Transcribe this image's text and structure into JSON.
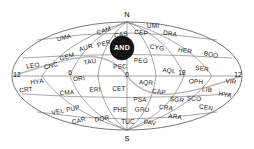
{
  "map": {
    "title": "Celestial constellation map",
    "projection": "hammer-aitoff-oval",
    "poles": {
      "north_label": "N",
      "south_label": "S"
    },
    "hour_markers": [
      {
        "label": "12",
        "x": 17,
        "y": 75
      },
      {
        "label": "6",
        "x": 70,
        "y": 73
      },
      {
        "label": "0",
        "x": 127,
        "y": 75
      },
      {
        "label": "18",
        "x": 182,
        "y": 73
      },
      {
        "label": "12",
        "x": 238,
        "y": 75
      }
    ],
    "colors": {
      "background": "#ffffff",
      "graticule": "#6d6d6d",
      "outline": "#555555",
      "ecliptic": "#b9b9b9",
      "label_text": "#1a1a1a",
      "highlight_fill": "#151515",
      "highlight_text": "#ffffff"
    },
    "highlight": {
      "label": "AND",
      "x": 122,
      "y": 48,
      "radius": 12
    },
    "constellations": [
      {
        "label": "CAM",
        "x": 104,
        "y": 31,
        "rotate": -20
      },
      {
        "label": "CAS",
        "x": 121,
        "y": 35,
        "rotate": -10
      },
      {
        "label": "CEP",
        "x": 141,
        "y": 33,
        "rotate": 8
      },
      {
        "label": "UMI",
        "x": 153,
        "y": 26,
        "rotate": 0
      },
      {
        "label": "DRA",
        "x": 170,
        "y": 34,
        "rotate": 10
      },
      {
        "label": "UMA",
        "x": 64,
        "y": 38,
        "rotate": -14
      },
      {
        "label": "AUR",
        "x": 86,
        "y": 48,
        "rotate": -18
      },
      {
        "label": "PER",
        "x": 104,
        "y": 44,
        "rotate": -16
      },
      {
        "label": "CYG",
        "x": 157,
        "y": 48,
        "rotate": 10
      },
      {
        "label": "HER",
        "x": 185,
        "y": 51,
        "rotate": 8
      },
      {
        "label": "BOO",
        "x": 211,
        "y": 55,
        "rotate": 12
      },
      {
        "label": "GEM",
        "x": 67,
        "y": 57,
        "rotate": -16
      },
      {
        "label": "TAU",
        "x": 90,
        "y": 62,
        "rotate": -10
      },
      {
        "label": "PSC",
        "x": 120,
        "y": 67,
        "rotate": -3
      },
      {
        "label": "PEG",
        "x": 141,
        "y": 61,
        "rotate": 4
      },
      {
        "label": "LEO",
        "x": 33,
        "y": 66,
        "rotate": -8
      },
      {
        "label": "CNC",
        "x": 51,
        "y": 66,
        "rotate": -14
      },
      {
        "label": "AQL",
        "x": 169,
        "y": 71,
        "rotate": 6
      },
      {
        "label": "SER",
        "x": 202,
        "y": 69,
        "rotate": 8
      },
      {
        "label": "VIR",
        "x": 231,
        "y": 82,
        "rotate": 6
      },
      {
        "label": "OPH",
        "x": 196,
        "y": 82,
        "rotate": 4
      },
      {
        "label": "HYA",
        "x": 37,
        "y": 82,
        "rotate": -8
      },
      {
        "label": "ORI",
        "x": 79,
        "y": 79,
        "rotate": -6
      },
      {
        "label": "AQR",
        "x": 146,
        "y": 83,
        "rotate": 4
      },
      {
        "label": "CRT",
        "x": 26,
        "y": 90,
        "rotate": -6
      },
      {
        "label": "CET",
        "x": 119,
        "y": 89,
        "rotate": 0
      },
      {
        "label": "ERI",
        "x": 95,
        "y": 90,
        "rotate": -4
      },
      {
        "label": "CMA",
        "x": 67,
        "y": 93,
        "rotate": -4
      },
      {
        "label": "CAP",
        "x": 159,
        "y": 92,
        "rotate": 6
      },
      {
        "label": "LIB",
        "x": 207,
        "y": 90,
        "rotate": 8
      },
      {
        "label": "HYA",
        "x": 225,
        "y": 95,
        "rotate": 10
      },
      {
        "label": "PSA",
        "x": 140,
        "y": 100,
        "rotate": 4
      },
      {
        "label": "SGR",
        "x": 177,
        "y": 100,
        "rotate": 6
      },
      {
        "label": "SCO",
        "x": 194,
        "y": 99,
        "rotate": 4
      },
      {
        "label": "VEL",
        "x": 58,
        "y": 112,
        "rotate": -14
      },
      {
        "label": "PUP",
        "x": 73,
        "y": 109,
        "rotate": -12
      },
      {
        "label": "PHE",
        "x": 120,
        "y": 110,
        "rotate": 0
      },
      {
        "label": "GRU",
        "x": 142,
        "y": 110,
        "rotate": 4
      },
      {
        "label": "CRA",
        "x": 166,
        "y": 108,
        "rotate": 8
      },
      {
        "label": "CEN",
        "x": 206,
        "y": 108,
        "rotate": 10
      },
      {
        "label": "ARA",
        "x": 175,
        "y": 117,
        "rotate": 8
      },
      {
        "label": "CAR",
        "x": 79,
        "y": 121,
        "rotate": -14
      },
      {
        "label": "DOR",
        "x": 102,
        "y": 119,
        "rotate": -8
      },
      {
        "label": "TUC",
        "x": 128,
        "y": 122,
        "rotate": 0
      },
      {
        "label": "PAV",
        "x": 150,
        "y": 123,
        "rotate": 8
      }
    ]
  }
}
